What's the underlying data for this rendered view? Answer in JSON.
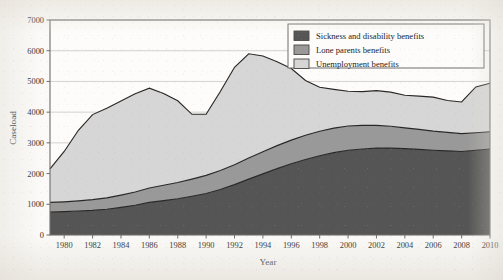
{
  "chart_data": {
    "type": "area",
    "stacked": true,
    "title": "",
    "xlabel": "Year",
    "ylabel": "Caseload",
    "xlim": [
      1979,
      2010
    ],
    "ylim": [
      0,
      7000
    ],
    "ytick_step": 1000,
    "xtick_step": 2,
    "grid": true,
    "grid_axis": "y",
    "legend_position": "top-right-inside",
    "yticks": [
      "0",
      "1000",
      "2000",
      "3000",
      "4000",
      "5000",
      "6000",
      "7000"
    ],
    "xticks": [
      "1980",
      "1982",
      "1984",
      "1986",
      "1988",
      "1990",
      "1992",
      "1994",
      "1996",
      "1998",
      "2000",
      "2002",
      "2004",
      "2006",
      "2008",
      "2010"
    ],
    "x": [
      1979,
      1980,
      1981,
      1982,
      1983,
      1984,
      1985,
      1986,
      1987,
      1988,
      1989,
      1990,
      1991,
      1992,
      1993,
      1994,
      1995,
      1996,
      1997,
      1998,
      1999,
      2000,
      2001,
      2002,
      2003,
      2004,
      2005,
      2006,
      2007,
      2008,
      2009,
      2010
    ],
    "series": [
      {
        "name": "Sickness and disability benefits",
        "color": "#555555",
        "values": [
          750,
          760,
          780,
          800,
          840,
          900,
          970,
          1060,
          1120,
          1180,
          1260,
          1350,
          1480,
          1640,
          1820,
          1990,
          2160,
          2320,
          2460,
          2580,
          2680,
          2760,
          2800,
          2830,
          2830,
          2810,
          2790,
          2760,
          2740,
          2720,
          2760,
          2800
        ]
      },
      {
        "name": "Lone parents benefits",
        "color": "#999999",
        "values": [
          310,
          320,
          330,
          350,
          370,
          400,
          430,
          470,
          500,
          530,
          560,
          590,
          620,
          650,
          690,
          720,
          750,
          770,
          790,
          800,
          800,
          790,
          770,
          740,
          710,
          680,
          650,
          620,
          600,
          580,
          570,
          560
        ]
      },
      {
        "name": "Unemployment benefits",
        "color": "#d6d6d6",
        "values": [
          1090,
          1640,
          2300,
          2770,
          2920,
          3060,
          3200,
          3250,
          2990,
          2660,
          2110,
          1990,
          2570,
          3170,
          3390,
          3120,
          2730,
          2330,
          1780,
          1430,
          1260,
          1130,
          1100,
          1130,
          1110,
          1060,
          1080,
          1110,
          1040,
          1030,
          1490,
          1580
        ]
      }
    ],
    "totals": [
      2150,
      2720,
      3410,
      3920,
      4130,
      4360,
      4600,
      4780,
      4610,
      4370,
      3930,
      3930,
      4670,
      5460,
      5900,
      5830,
      5640,
      5420,
      5030,
      4810,
      4740,
      4680,
      4670,
      4700,
      4650,
      4550,
      4520,
      4490,
      4380,
      4330,
      4820,
      4940
    ],
    "annotations": {
      "peak_year": 1993,
      "peak_total": 5900,
      "secondary_peak_year": 1986,
      "secondary_peak_total": 4780
    }
  },
  "legend": {
    "entries": [
      {
        "label": "Sickness and disability benefits",
        "swatch_color": "#555555"
      },
      {
        "label": "Lone parents benefits",
        "swatch_color": "#999999"
      },
      {
        "label": "Unemployment benefits",
        "swatch_color": "#d6d6d6"
      }
    ]
  },
  "axes": {
    "y_title": "Caseload",
    "x_title": "Year"
  },
  "colors": {
    "frame": "#6f6d6a",
    "grid": "#c9c7c3",
    "series_line": "#2a2826",
    "text": "#24221f"
  }
}
